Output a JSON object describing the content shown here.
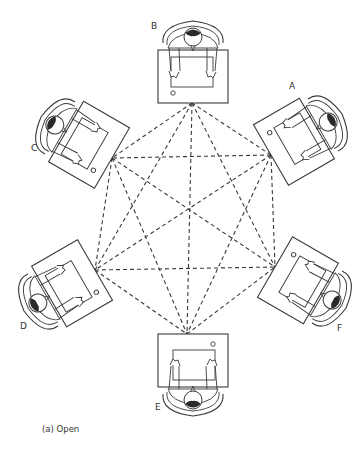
{
  "figure": {
    "caption": "(a) Open",
    "line_color": "#3a3a3a",
    "background": "#ffffff"
  },
  "stations": [
    {
      "id": "A",
      "label": "A",
      "vertex": [
        271,
        155
      ],
      "label_pos": [
        289,
        85
      ],
      "rotation": 60
    },
    {
      "id": "B",
      "label": "B",
      "vertex": [
        192,
        103
      ],
      "label_pos": [
        151,
        24
      ],
      "rotation": 0
    },
    {
      "id": "C",
      "label": "C",
      "vertex": [
        112,
        158
      ],
      "label_pos": [
        31,
        147
      ],
      "rotation": -60
    },
    {
      "id": "D",
      "label": "D",
      "vertex": [
        95,
        270
      ],
      "label_pos": [
        20,
        325
      ],
      "rotation": -120
    },
    {
      "id": "E",
      "label": "E",
      "vertex": [
        187,
        334
      ],
      "label_pos": [
        156,
        405
      ],
      "rotation": 180
    },
    {
      "id": "F",
      "label": "F",
      "vertex": [
        275,
        267
      ],
      "label_pos": [
        338,
        326
      ],
      "rotation": 120
    }
  ],
  "connections": "all pairs connected by dashed lines (complete graph of 6 stations)"
}
